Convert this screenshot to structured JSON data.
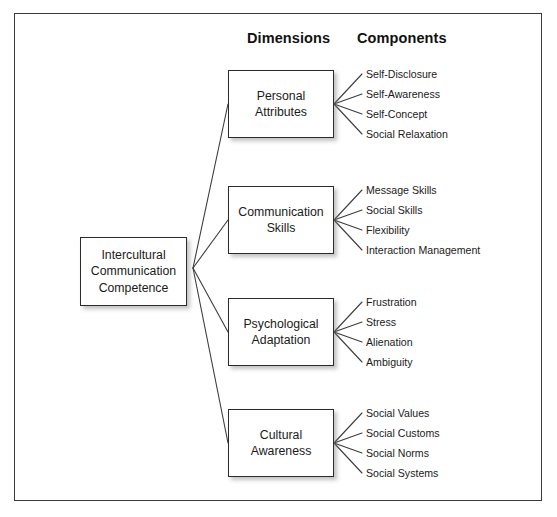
{
  "figure": {
    "headers": {
      "dimensions": "Dimensions",
      "components": "Components"
    },
    "center_node": {
      "label": "Intercultural\nCommunication\nCompetence"
    },
    "branches": [
      {
        "dimension": "Personal\nAttributes",
        "components": [
          "Self-Disclosure",
          "Self-Awareness",
          "Self-Concept",
          "Social Relaxation"
        ]
      },
      {
        "dimension": "Communication\nSkills",
        "components": [
          "Message Skills",
          "Social Skills",
          "Flexibility",
          "Interaction Management"
        ]
      },
      {
        "dimension": "Psychological\nAdaptation",
        "components": [
          "Frustration",
          "Stress",
          "Alienation",
          "Ambiguity"
        ]
      },
      {
        "dimension": "Cultural\nAwareness",
        "components": [
          "Social Values",
          "Social Customs",
          "Social Norms",
          "Social Systems"
        ]
      }
    ],
    "colors": {
      "frame_border": "#3a3a3a",
      "node_border": "#2b2b2b",
      "connector": "#3d3d3d",
      "text": "#1a1a1a",
      "background": "#ffffff"
    }
  }
}
